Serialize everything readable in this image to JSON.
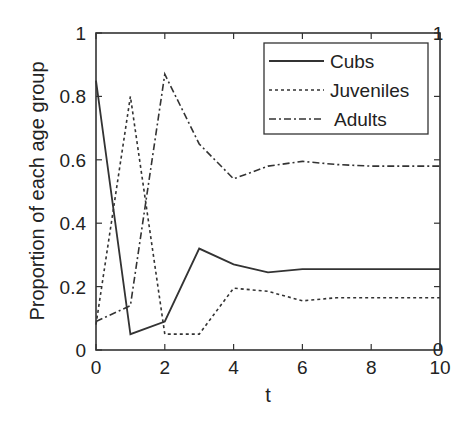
{
  "chart_data": {
    "type": "line",
    "title": "",
    "xlabel": "t",
    "ylabel": "Proportion of each age group",
    "xlim": [
      0,
      10
    ],
    "ylim": [
      0,
      1
    ],
    "xticks": [
      "0",
      "2",
      "4",
      "6",
      "8",
      "10"
    ],
    "yticks": [
      "0",
      "0.2",
      "0.4",
      "0.6",
      "0.8",
      "1"
    ],
    "right_axis_ticks": [
      "0",
      "1"
    ],
    "grid": false,
    "legend_position": "upper right",
    "x": [
      0,
      1,
      2,
      3,
      4,
      5,
      6,
      7,
      8,
      9,
      10
    ],
    "series": [
      {
        "name": "Cubs",
        "style": "solid",
        "values": [
          0.85,
          0.05,
          0.09,
          0.32,
          0.27,
          0.245,
          0.255,
          0.255,
          0.255,
          0.255,
          0.255
        ]
      },
      {
        "name": "Juveniles",
        "style": "dotted",
        "values": [
          0.08,
          0.8,
          0.05,
          0.05,
          0.195,
          0.185,
          0.155,
          0.165,
          0.165,
          0.165,
          0.165
        ]
      },
      {
        "name": "Adults",
        "style": "dashdot",
        "values": [
          0.09,
          0.14,
          0.87,
          0.65,
          0.54,
          0.58,
          0.595,
          0.585,
          0.58,
          0.58,
          0.58
        ]
      }
    ]
  }
}
